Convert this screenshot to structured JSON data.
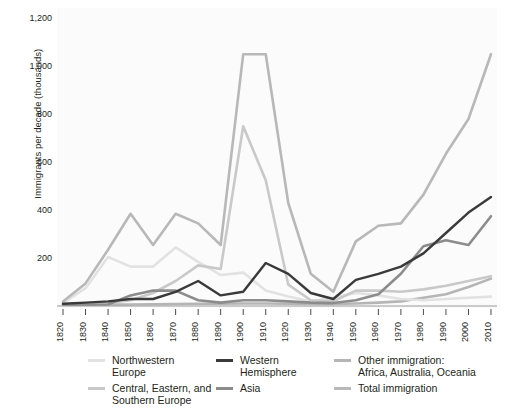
{
  "chart_data": {
    "type": "line",
    "title": "",
    "subtitle": "",
    "xlabel": "",
    "ylabel": "Immigrants per decade\n(thousands)",
    "xlim": [
      1820,
      2010
    ],
    "ylim": [
      0,
      1200
    ],
    "yticks": [
      200,
      400,
      600,
      800,
      1000,
      1200
    ],
    "ytick_labels": [
      "200",
      "400",
      "600",
      "800",
      "1,000",
      "1,200"
    ],
    "grid": false,
    "legend_position": "bottom",
    "x": [
      1820,
      1830,
      1840,
      1850,
      1860,
      1870,
      1880,
      1890,
      1900,
      1910,
      1920,
      1930,
      1940,
      1950,
      1960,
      1970,
      1980,
      1990,
      2000,
      2010
    ],
    "xtick_labels": [
      "1820",
      "1830",
      "1840",
      "1850",
      "1860",
      "1870",
      "1880",
      "1890",
      "1900",
      "1910",
      "1920",
      "1930",
      "1940",
      "1950",
      "1960",
      "1970",
      "1980",
      "1990",
      "2000",
      "2010"
    ],
    "series": [
      {
        "name": "Northwestern Europe",
        "color": "#e2e2e2",
        "values": [
          8,
          70,
          200,
          160,
          160,
          240,
          180,
          125,
          135,
          60,
          35,
          15,
          30,
          50,
          40,
          25,
          20,
          25,
          30,
          35
        ]
      },
      {
        "name": "Central, Eastern, and Southern Europe",
        "color": "#c9c9c9",
        "values": [
          2,
          4,
          8,
          20,
          50,
          100,
          165,
          150,
          745,
          520,
          85,
          20,
          15,
          60,
          60,
          55,
          65,
          80,
          100,
          120
        ]
      },
      {
        "name": "Western Hemisphere",
        "color": "#3a3a3a",
        "values": [
          5,
          10,
          15,
          25,
          25,
          55,
          100,
          40,
          55,
          175,
          130,
          50,
          25,
          105,
          130,
          160,
          215,
          300,
          385,
          450
        ]
      },
      {
        "name": "Asia",
        "color": "#8c8c8c",
        "values": [
          1,
          1,
          2,
          40,
          60,
          60,
          20,
          10,
          20,
          20,
          15,
          10,
          8,
          20,
          45,
          130,
          245,
          270,
          250,
          370
        ]
      },
      {
        "name": "Other immigration: Africa, Australia, Oceania",
        "color": "#b5b5b5",
        "values": [
          1,
          1,
          2,
          2,
          3,
          4,
          5,
          5,
          6,
          6,
          5,
          4,
          4,
          6,
          10,
          15,
          30,
          45,
          75,
          110
        ]
      },
      {
        "name": "Total immigration",
        "color": "#b8b8b8",
        "values": [
          15,
          90,
          230,
          380,
          250,
          380,
          340,
          250,
          1045,
          1045,
          425,
          130,
          55,
          265,
          330,
          340,
          460,
          630,
          775,
          1045
        ]
      }
    ]
  },
  "legend": {
    "items": [
      {
        "label": "Northwestern\nEurope",
        "color": "#e2e2e2"
      },
      {
        "label": "Western\nHemisphere",
        "color": "#3a3a3a"
      },
      {
        "label": "Other immigration:\nAfrica, Australia, Oceania",
        "color": "#b5b5b5"
      },
      {
        "label": "Central, Eastern, and\nSouthern Europe",
        "color": "#c9c9c9"
      },
      {
        "label": "Asia",
        "color": "#8c8c8c"
      },
      {
        "label": "Total immigration",
        "color": "#b8b8b8"
      }
    ]
  }
}
